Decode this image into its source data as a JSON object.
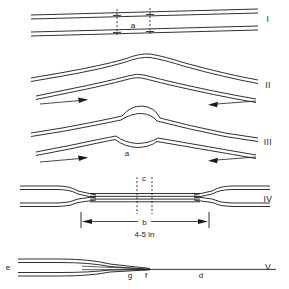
{
  "figure": {
    "title": "",
    "type": "technical-line-diagram",
    "background_color": "#ffffff",
    "line_color": "#1a1a1a",
    "width": 289,
    "height": 289,
    "panels": [
      {
        "id": "panel-1",
        "numeral": "I",
        "numeral_y": 22,
        "description": "Two straight parallel strand pairs lying side by side, slightly inclined; a short segment between two dashed cross marks is labelled a.",
        "labels": [
          {
            "key": "a",
            "text": "a",
            "x": 133,
            "y": 28
          }
        ],
        "dashed_marks_x": [
          117,
          150
        ],
        "arrows": []
      },
      {
        "id": "panel-2",
        "numeral": "II",
        "numeral_y": 88,
        "description": "The two strand pairs pushed together forming a peaked arch at centre; arrows show the two ends being pushed toward each other.",
        "labels": [],
        "arrows": [
          {
            "key": "arrow-left",
            "direction": "right",
            "x1": 40,
            "y1": 100,
            "x2": 88,
            "y2": 97
          },
          {
            "key": "arrow-right",
            "direction": "left",
            "x1": 256,
            "y1": 97,
            "x2": 206,
            "y2": 100
          }
        ]
      },
      {
        "id": "panel-3",
        "numeral": "III",
        "numeral_y": 145,
        "description": "Same arched configuration with a small rounded loop bulge forming at the crossing point, labelled a; compression arrows continue from both ends.",
        "labels": [
          {
            "key": "a",
            "text": "a",
            "x": 127,
            "y": 153
          }
        ],
        "arrows": [
          {
            "key": "arrow-left",
            "direction": "right",
            "x1": 40,
            "y1": 160,
            "x2": 88,
            "y2": 157
          },
          {
            "key": "arrow-right",
            "direction": "left",
            "x1": 256,
            "y1": 157,
            "x2": 206,
            "y2": 160
          }
        ]
      },
      {
        "id": "panel-4",
        "numeral": "IV",
        "numeral_y": 202,
        "description": "Finished straight splice: the two strand pairs tapered and laid together over a central overlap; a dimension line marks the overlap length b, noted as 4-5 in, and a short dashed interval at the centre is labelled c.",
        "labels": [
          {
            "key": "c",
            "text": "c",
            "x": 141,
            "y": 180
          },
          {
            "key": "b",
            "text": "b",
            "x": 144,
            "y": 223
          }
        ],
        "dimension": {
          "key": "overlap-length",
          "symbol": "b",
          "value_text": "4-5 in",
          "value_x": 144,
          "value_y": 235,
          "x_start": 81,
          "x_end": 209,
          "y": 222
        },
        "dashed_marks_x": [
          137,
          152
        ],
        "arrows": []
      },
      {
        "id": "panel-5",
        "numeral": "V",
        "numeral_y": 270,
        "description": "Side view of the tapered and wrapped finished joint running out to a single thin line; the opened strands at the left are e, the taper zone g, the tie-off point f and the finished single line d.",
        "labels": [
          {
            "key": "e",
            "text": "e",
            "x": 8,
            "y": 270
          },
          {
            "key": "g",
            "text": "g",
            "x": 130,
            "y": 277
          },
          {
            "key": "f",
            "text": "f",
            "x": 146,
            "y": 277
          },
          {
            "key": "d",
            "text": "d",
            "x": 201,
            "y": 277
          }
        ],
        "arrows": []
      }
    ],
    "numerals": [
      "I",
      "II",
      "III",
      "IV",
      "V"
    ],
    "numeral_x": 268,
    "all_labels": [
      "a",
      "a",
      "c",
      "b",
      "4-5 in",
      "e",
      "g",
      "f",
      "d"
    ]
  }
}
